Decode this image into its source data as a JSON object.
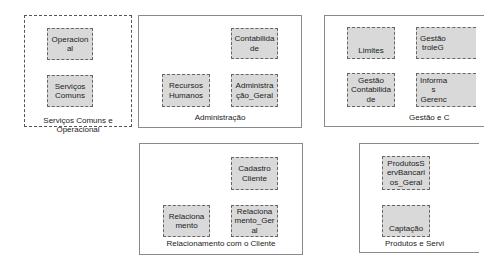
{
  "groups": [
    {
      "id": "servicos-comuns-operacional",
      "label": "Serviços Comuns e\nOperacional",
      "style": "dashed",
      "nodes": [
        {
          "label": "Operacion\nal"
        },
        {
          "label": "Serviços\nComuns"
        }
      ]
    },
    {
      "id": "administracao",
      "label": "Administração",
      "style": "solid",
      "nodes": [
        {
          "label": "Contabilida\nde"
        },
        {
          "label": "Recursos\nHumanos"
        },
        {
          "label": "Administra\nção_Geral"
        }
      ]
    },
    {
      "id": "gestao",
      "label": "Gestão e C",
      "style": "solid",
      "nodes": [
        {
          "label": "Limites"
        },
        {
          "label": "Gestão\ntroleG"
        },
        {
          "label": "Gestão\nContabilida\nde"
        },
        {
          "label": "Informa\ns\nGerenc"
        }
      ]
    },
    {
      "id": "relacionamento-cliente",
      "label": "Relacionamento com o Cliente",
      "style": "solid",
      "nodes": [
        {
          "label": "Cadastro\nCliente"
        },
        {
          "label": "Relaciona\nmento"
        },
        {
          "label": "Relaciona\nmento_Ger\nal"
        }
      ]
    },
    {
      "id": "produtos-servicos",
      "label": "Produtos e Servi",
      "style": "solid",
      "nodes": [
        {
          "label": "ProdutosS\nervBancari\nos_Geral"
        },
        {
          "label": "Captação"
        }
      ]
    }
  ],
  "colors": {
    "node_fill": "#d9d9d9",
    "node_border": "#666666",
    "group_border": "#8a8a8a"
  }
}
